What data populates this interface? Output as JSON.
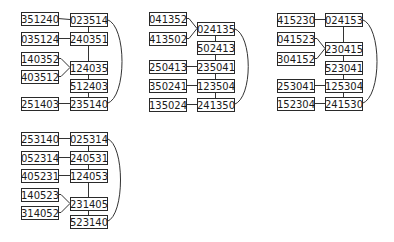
{
  "style": {
    "stroke": "#2a2a2a",
    "text": "#1a1a1a",
    "background": "#ffffff"
  },
  "box": {
    "w": 37,
    "h": 13
  },
  "diagrams": [
    {
      "id": "d1",
      "nodes": [
        {
          "id": "351240",
          "x": 21,
          "y": 12
        },
        {
          "id": "023514",
          "x": 70,
          "y": 13
        },
        {
          "id": "035124",
          "x": 21,
          "y": 32
        },
        {
          "id": "240351",
          "x": 70,
          "y": 32
        },
        {
          "id": "140352",
          "x": 21,
          "y": 52
        },
        {
          "id": "124035",
          "x": 70,
          "y": 61
        },
        {
          "id": "403512",
          "x": 21,
          "y": 70
        },
        {
          "id": "512403",
          "x": 70,
          "y": 79
        },
        {
          "id": "251403",
          "x": 21,
          "y": 97
        },
        {
          "id": "235140",
          "x": 70,
          "y": 97
        }
      ],
      "edges": [
        [
          "351240",
          "023514",
          "h"
        ],
        [
          "035124",
          "240351",
          "h"
        ],
        [
          "140352",
          "124035",
          "d"
        ],
        [
          "403512",
          "124035",
          "d"
        ],
        [
          "251403",
          "235140",
          "h"
        ],
        [
          "023514",
          "240351",
          "v"
        ],
        [
          "240351",
          "124035",
          "v"
        ],
        [
          "124035",
          "512403",
          "v"
        ],
        [
          "512403",
          "235140",
          "v"
        ],
        [
          "023514",
          "235140",
          "arc"
        ]
      ],
      "arc_x": 127
    },
    {
      "id": "d2",
      "nodes": [
        {
          "id": "041352",
          "x": 149,
          "y": 12
        },
        {
          "id": "024135",
          "x": 197,
          "y": 22
        },
        {
          "id": "413502",
          "x": 149,
          "y": 32
        },
        {
          "id": "502413",
          "x": 197,
          "y": 41
        },
        {
          "id": "250413",
          "x": 149,
          "y": 60
        },
        {
          "id": "235041",
          "x": 197,
          "y": 60
        },
        {
          "id": "350241",
          "x": 149,
          "y": 79
        },
        {
          "id": "123504",
          "x": 197,
          "y": 79
        },
        {
          "id": "135024",
          "x": 149,
          "y": 98
        },
        {
          "id": "241350",
          "x": 197,
          "y": 98
        }
      ],
      "edges": [
        [
          "041352",
          "024135",
          "d"
        ],
        [
          "413502",
          "024135",
          "d"
        ],
        [
          "250413",
          "235041",
          "h"
        ],
        [
          "350241",
          "123504",
          "h"
        ],
        [
          "135024",
          "241350",
          "h"
        ],
        [
          "024135",
          "502413",
          "v"
        ],
        [
          "502413",
          "235041",
          "v"
        ],
        [
          "235041",
          "123504",
          "v"
        ],
        [
          "123504",
          "241350",
          "v"
        ],
        [
          "024135",
          "241350",
          "arc"
        ]
      ],
      "arc_x": 253
    },
    {
      "id": "d3",
      "nodes": [
        {
          "id": "415230",
          "x": 277,
          "y": 13
        },
        {
          "id": "024153",
          "x": 325,
          "y": 13
        },
        {
          "id": "041523",
          "x": 277,
          "y": 32
        },
        {
          "id": "230415",
          "x": 325,
          "y": 42
        },
        {
          "id": "304152",
          "x": 277,
          "y": 52
        },
        {
          "id": "523041",
          "x": 325,
          "y": 61
        },
        {
          "id": "253041",
          "x": 277,
          "y": 79
        },
        {
          "id": "125304",
          "x": 325,
          "y": 79
        },
        {
          "id": "152304",
          "x": 277,
          "y": 97
        },
        {
          "id": "241530",
          "x": 325,
          "y": 97
        }
      ],
      "edges": [
        [
          "415230",
          "024153",
          "h"
        ],
        [
          "041523",
          "230415",
          "d"
        ],
        [
          "304152",
          "230415",
          "d"
        ],
        [
          "253041",
          "125304",
          "h"
        ],
        [
          "152304",
          "241530",
          "h"
        ],
        [
          "024153",
          "230415",
          "v"
        ],
        [
          "230415",
          "523041",
          "v"
        ],
        [
          "523041",
          "125304",
          "v"
        ],
        [
          "125304",
          "241530",
          "v"
        ],
        [
          "024153",
          "241530",
          "arc"
        ]
      ],
      "arc_x": 382
    },
    {
      "id": "d4",
      "nodes": [
        {
          "id": "253140",
          "x": 21,
          "y": 132
        },
        {
          "id": "025314",
          "x": 70,
          "y": 132
        },
        {
          "id": "052314",
          "x": 21,
          "y": 151
        },
        {
          "id": "240531",
          "x": 70,
          "y": 151
        },
        {
          "id": "405231",
          "x": 21,
          "y": 169
        },
        {
          "id": "124053",
          "x": 70,
          "y": 169
        },
        {
          "id": "140523",
          "x": 21,
          "y": 188
        },
        {
          "id": "231405",
          "x": 70,
          "y": 197
        },
        {
          "id": "314052",
          "x": 21,
          "y": 206
        },
        {
          "id": "523140",
          "x": 70,
          "y": 215
        }
      ],
      "edges": [
        [
          "253140",
          "025314",
          "h"
        ],
        [
          "052314",
          "240531",
          "h"
        ],
        [
          "405231",
          "124053",
          "h"
        ],
        [
          "140523",
          "231405",
          "d"
        ],
        [
          "314052",
          "231405",
          "d"
        ],
        [
          "025314",
          "240531",
          "v"
        ],
        [
          "240531",
          "124053",
          "v"
        ],
        [
          "124053",
          "231405",
          "v"
        ],
        [
          "231405",
          "523140",
          "v"
        ],
        [
          "025314",
          "523140",
          "arc"
        ]
      ],
      "arc_x": 125
    }
  ]
}
